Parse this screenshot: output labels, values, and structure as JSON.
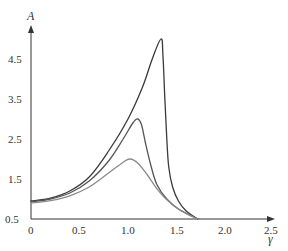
{
  "chart_data": {
    "type": "line",
    "title": "",
    "xlabel": "γ",
    "ylabel": "A",
    "xlim": [
      0,
      2.5
    ],
    "ylim": [
      0.5,
      5.2
    ],
    "grid": false,
    "legend": null,
    "x_ticks": [
      "0",
      "0.5",
      "1.0",
      "1.5",
      "2.0",
      "2.5"
    ],
    "y_ticks": [
      "0.5",
      "1.5",
      "2.5",
      "3.5",
      "4.5"
    ],
    "series": [
      {
        "name": "curve-high",
        "color": "#3a3a3a",
        "points": [
          [
            0,
            0.95
          ],
          [
            0.2,
            1.02
          ],
          [
            0.4,
            1.2
          ],
          [
            0.6,
            1.55
          ],
          [
            0.8,
            2.2
          ],
          [
            1.0,
            3.0
          ],
          [
            1.15,
            3.8
          ],
          [
            1.25,
            4.5
          ],
          [
            1.34,
            5.0
          ],
          [
            1.36,
            4.6
          ],
          [
            1.38,
            3.5
          ],
          [
            1.4,
            2.5
          ],
          [
            1.42,
            1.8
          ],
          [
            1.46,
            1.3
          ],
          [
            1.52,
            0.95
          ],
          [
            1.6,
            0.7
          ],
          [
            1.72,
            0.5
          ]
        ]
      },
      {
        "name": "curve-mid",
        "color": "#555555",
        "points": [
          [
            0,
            0.93
          ],
          [
            0.2,
            1.0
          ],
          [
            0.4,
            1.15
          ],
          [
            0.6,
            1.45
          ],
          [
            0.8,
            1.95
          ],
          [
            0.95,
            2.5
          ],
          [
            1.05,
            2.9
          ],
          [
            1.1,
            3.0
          ],
          [
            1.14,
            2.85
          ],
          [
            1.18,
            2.4
          ],
          [
            1.24,
            1.8
          ],
          [
            1.3,
            1.35
          ],
          [
            1.4,
            1.0
          ],
          [
            1.52,
            0.75
          ],
          [
            1.72,
            0.5
          ]
        ]
      },
      {
        "name": "curve-low",
        "color": "#8a8a8a",
        "points": [
          [
            0,
            0.9
          ],
          [
            0.2,
            0.96
          ],
          [
            0.4,
            1.08
          ],
          [
            0.6,
            1.3
          ],
          [
            0.8,
            1.65
          ],
          [
            0.95,
            1.92
          ],
          [
            1.02,
            2.0
          ],
          [
            1.1,
            1.9
          ],
          [
            1.2,
            1.6
          ],
          [
            1.3,
            1.25
          ],
          [
            1.4,
            0.98
          ],
          [
            1.55,
            0.7
          ],
          [
            1.72,
            0.5
          ]
        ]
      }
    ]
  },
  "labels": {
    "x_axis": "γ",
    "y_axis": "A",
    "x_ticks": [
      "0",
      "0.5",
      "1.0",
      "1.5",
      "2.0",
      "2.5"
    ],
    "y_ticks": [
      "0.5",
      "1.5",
      "2.5",
      "3.5",
      "4.5"
    ]
  }
}
